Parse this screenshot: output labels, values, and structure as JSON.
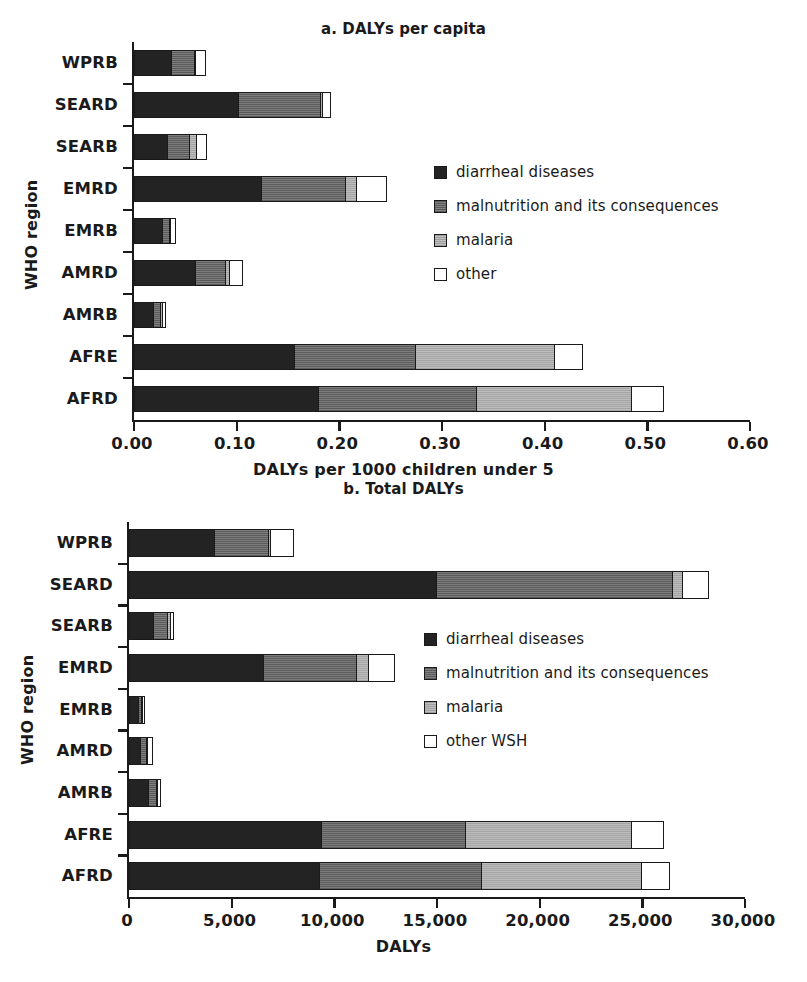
{
  "figure": {
    "panels": [
      "a",
      "b"
    ]
  },
  "chart_data": [
    {
      "type": "bar",
      "orientation": "horizontal",
      "stacked": true,
      "title": "a. DALYs per capita",
      "xlabel": "DALYs per 1000 children under 5",
      "ylabel": "WHO region",
      "xlim": [
        0,
        0.6
      ],
      "xticks": [
        0,
        0.1,
        0.2,
        0.3,
        0.4,
        0.5,
        0.6
      ],
      "xticklabels": [
        "0.00",
        "0.10",
        "0.20",
        "0.30",
        "0.40",
        "0.50",
        "0.60"
      ],
      "grid": false,
      "legend_position": "center-right",
      "categories": [
        "WPRB",
        "SEARD",
        "SEARB",
        "EMRD",
        "EMRB",
        "AMRD",
        "AMRB",
        "AFRE",
        "AFRD"
      ],
      "series": [
        {
          "name": "diarrheal diseases",
          "values": [
            0.035,
            0.1,
            0.031,
            0.123,
            0.026,
            0.058,
            0.018,
            0.155,
            0.178
          ]
        },
        {
          "name": "malnutrition and its consequences",
          "values": [
            0.022,
            0.08,
            0.022,
            0.082,
            0.007,
            0.03,
            0.006,
            0.118,
            0.154
          ]
        },
        {
          "name": "malaria",
          "values": [
            0.001,
            0.002,
            0.006,
            0.01,
            0.001,
            0.004,
            0.002,
            0.135,
            0.151
          ]
        },
        {
          "name": "other",
          "values": [
            0.009,
            0.007,
            0.009,
            0.028,
            0.004,
            0.011,
            0.002,
            0.026,
            0.03
          ]
        }
      ],
      "totals": [
        0.067,
        0.189,
        0.068,
        0.243,
        0.038,
        0.103,
        0.028,
        0.434,
        0.513
      ]
    },
    {
      "type": "bar",
      "orientation": "horizontal",
      "stacked": true,
      "title": "b. Total DALYs",
      "xlabel": "DALYs",
      "ylabel": "WHO region",
      "xlim": [
        0,
        30000
      ],
      "xticks": [
        0,
        5000,
        10000,
        15000,
        20000,
        25000,
        30000
      ],
      "xticklabels": [
        "0",
        "5,000",
        "10,000",
        "15,000",
        "20,000",
        "25,000",
        "30,000"
      ],
      "grid": false,
      "legend_position": "center-right",
      "categories": [
        "WPRB",
        "SEARD",
        "SEARB",
        "EMRD",
        "EMRB",
        "AMRD",
        "AMRB",
        "AFRE",
        "AFRD"
      ],
      "series": [
        {
          "name": "diarrheal diseases",
          "values": [
            4100,
            14900,
            1100,
            6500,
            400,
            500,
            900,
            9300,
            9200
          ]
        },
        {
          "name": "malnutrition and its consequences",
          "values": [
            2600,
            11500,
            700,
            4500,
            150,
            300,
            350,
            7000,
            7900
          ]
        },
        {
          "name": "malaria",
          "values": [
            100,
            500,
            150,
            600,
            30,
            50,
            50,
            8100,
            7800
          ]
        },
        {
          "name": "other WSH",
          "values": [
            1100,
            1200,
            100,
            1200,
            40,
            150,
            100,
            1500,
            1300
          ]
        }
      ],
      "totals": [
        7900,
        28100,
        2050,
        12800,
        620,
        1000,
        1400,
        25900,
        26200
      ]
    }
  ],
  "panel_a": {
    "title": "a. DALYs per capita",
    "y_axis_title": "WHO region",
    "x_axis_title": "DALYs per 1000 children under 5",
    "legend": [
      {
        "label": "diarrheal diseases",
        "swatch": "solid-dark"
      },
      {
        "label": "malnutrition and its consequences",
        "swatch": "medium-gray"
      },
      {
        "label": "malaria",
        "swatch": "light-gray"
      },
      {
        "label": "other",
        "swatch": "white"
      }
    ]
  },
  "panel_b": {
    "title": "b. Total DALYs",
    "y_axis_title": "WHO region",
    "x_axis_title": "DALYs",
    "legend": [
      {
        "label": "diarrheal diseases",
        "swatch": "solid-dark"
      },
      {
        "label": "malnutrition and its consequences",
        "swatch": "medium-gray"
      },
      {
        "label": "malaria",
        "swatch": "light-gray"
      },
      {
        "label": "other WSH",
        "swatch": "white"
      }
    ]
  },
  "colors": {
    "series_0": "#232323",
    "series_1": "#6f6f6f",
    "series_2": "#b5b5b5",
    "series_3": "#ffffff",
    "axis": "#1a1a1a"
  }
}
